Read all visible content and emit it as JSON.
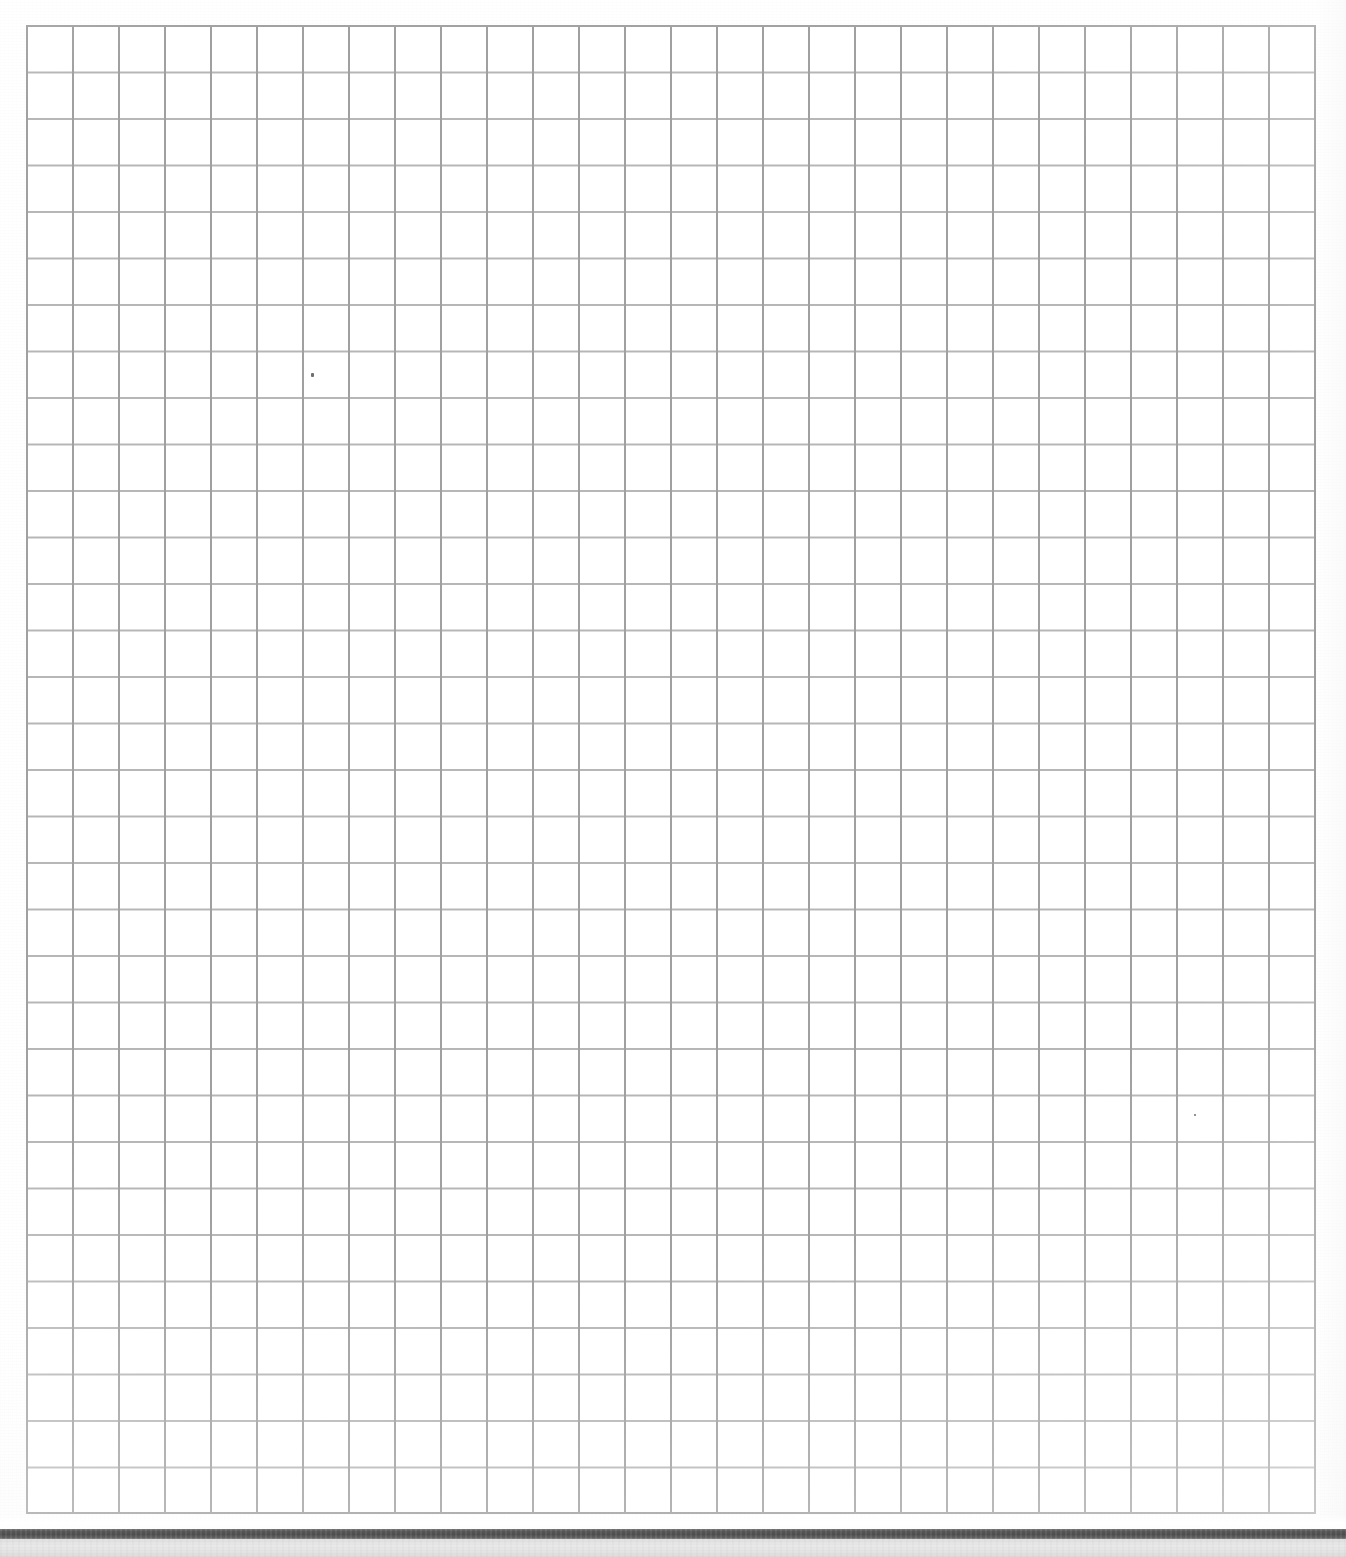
{
  "document": {
    "kind": "scanned-graph-paper",
    "title": "Blank quadrille graph paper scan",
    "page_background": "#ffffff",
    "has_text": false,
    "has_handwriting": false,
    "visible_text": []
  },
  "canvas": {
    "width": 1346,
    "height": 1557
  },
  "grid": {
    "label": "ruled square grid",
    "columns": 28,
    "rows": 32,
    "cell_width": 46.0,
    "cell_height": 46.5,
    "left": 26,
    "top": 25,
    "width": 1290,
    "height": 1489,
    "line_color": "#a0a0a0",
    "minor_line_color": "#b0b0b0",
    "border_color": "#9a9a9a",
    "line_width": 2,
    "fill_color": "#ffffff",
    "has_labels": false,
    "has_axis_numbers": false
  },
  "marks": {
    "specks": [
      {
        "name": "toner-speck",
        "x": 311,
        "y": 373,
        "w": 3,
        "h": 4
      },
      {
        "name": "toner-speck",
        "x": 1194,
        "y": 1114,
        "w": 2,
        "h": 2
      }
    ]
  },
  "spine_bar": {
    "label": "scanner edge shadow bar",
    "top": 1529,
    "height": 10,
    "color": "#555555",
    "full_width": true
  },
  "under_bar": {
    "label": "gray strip below page edge",
    "top": 1539,
    "height": 18,
    "color": "#e6e6e6"
  },
  "page_edge_highlight": {
    "top": 1514,
    "height": 15,
    "color": "#ffffff"
  },
  "chart_data": {
    "type": "table",
    "title": "",
    "subtitle": "",
    "xlabel": "",
    "ylabel": "",
    "categories": [],
    "values": [],
    "series": [],
    "grid": true,
    "legend": "none"
  }
}
